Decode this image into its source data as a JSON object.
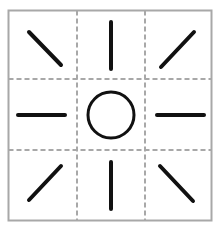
{
  "diagram": {
    "frame": {
      "x": 8.5,
      "y": 10.5,
      "width": 203,
      "height": 210,
      "stroke": "#a8a8a8"
    },
    "grid": {
      "dash_color": "#a8a8a8",
      "vertical_x": [
        77,
        145
      ],
      "horizontal_y": [
        79,
        150
      ]
    },
    "center_circle": {
      "cx": 111,
      "cy": 115,
      "r": 23,
      "stroke": "#111111",
      "stroke_width": 3
    },
    "stroke_color": "#111111",
    "rays": [
      {
        "name": "ray-top-left",
        "x1": 29,
        "y1": 32,
        "x2": 61,
        "y2": 65
      },
      {
        "name": "ray-top",
        "x1": 111,
        "y1": 22,
        "x2": 111,
        "y2": 69
      },
      {
        "name": "ray-top-right",
        "x1": 194,
        "y1": 32,
        "x2": 161,
        "y2": 67
      },
      {
        "name": "ray-left",
        "x1": 18,
        "y1": 115,
        "x2": 65,
        "y2": 115
      },
      {
        "name": "ray-right",
        "x1": 157,
        "y1": 115,
        "x2": 204,
        "y2": 115
      },
      {
        "name": "ray-bottom-left",
        "x1": 29,
        "y1": 200,
        "x2": 61,
        "y2": 166
      },
      {
        "name": "ray-bottom",
        "x1": 111,
        "y1": 162,
        "x2": 111,
        "y2": 209
      },
      {
        "name": "ray-bottom-right",
        "x1": 160,
        "y1": 166,
        "x2": 193,
        "y2": 201
      }
    ]
  }
}
